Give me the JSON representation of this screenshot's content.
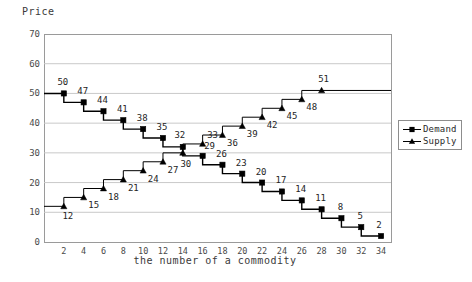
{
  "chart_data": {
    "type": "line",
    "title": "",
    "ylabel": "Price",
    "xlabel": "the number of a commodity",
    "xlim": [
      0,
      35
    ],
    "ylim": [
      0,
      70
    ],
    "x_ticks": [
      2,
      4,
      6,
      8,
      10,
      12,
      14,
      16,
      18,
      20,
      22,
      24,
      26,
      28,
      30,
      32,
      34
    ],
    "y_ticks": [
      0,
      10,
      20,
      30,
      40,
      50,
      60,
      70
    ],
    "grid": "horizontal",
    "step_style": "post",
    "legend_position": "right-middle",
    "series": [
      {
        "name": "Demand",
        "marker": "square",
        "color": "#000000",
        "x": [
          2,
          4,
          6,
          8,
          10,
          12,
          14,
          16,
          18,
          20,
          22,
          24,
          26,
          28,
          30,
          32,
          34
        ],
        "values": [
          50,
          47,
          44,
          41,
          38,
          35,
          32,
          29,
          26,
          23,
          20,
          17,
          14,
          11,
          8,
          5,
          2
        ],
        "labels": [
          "50",
          "47",
          "44",
          "41",
          "38",
          "35",
          "32",
          "29",
          "26",
          "23",
          "20",
          "17",
          "14",
          "11",
          "8",
          "5",
          "2"
        ]
      },
      {
        "name": "Supply",
        "marker": "triangle",
        "color": "#000000",
        "x": [
          2,
          4,
          6,
          8,
          10,
          12,
          14,
          16,
          18,
          20,
          22,
          24,
          26,
          28
        ],
        "values": [
          12,
          15,
          18,
          21,
          24,
          27,
          30,
          33,
          36,
          39,
          42,
          45,
          48,
          51
        ],
        "labels": [
          "12",
          "15",
          "18",
          "21",
          "24",
          "27",
          "30",
          "33",
          "36",
          "39",
          "42",
          "45",
          "48",
          "51"
        ]
      }
    ]
  },
  "legend": {
    "entries": [
      {
        "label": "Demand",
        "marker": "square"
      },
      {
        "label": "Supply",
        "marker": "triangle"
      }
    ]
  }
}
